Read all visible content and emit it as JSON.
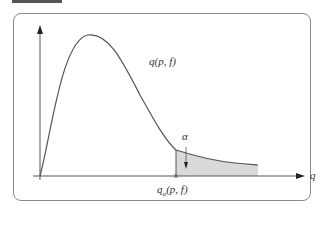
{
  "figure": {
    "type": "probability-density-diagram",
    "header_fragment": "",
    "curve_label": "q(p, f)",
    "x_axis_label": "q",
    "alpha_label": "α",
    "critical_label_main": "q",
    "critical_label_sub": "α",
    "critical_label_tail": "(p, f)",
    "colors": {
      "curve": "#555555",
      "axis": "#555555",
      "shade": "#d9d9d9",
      "frame": "#8a8a8a",
      "text": "#333333"
    }
  }
}
